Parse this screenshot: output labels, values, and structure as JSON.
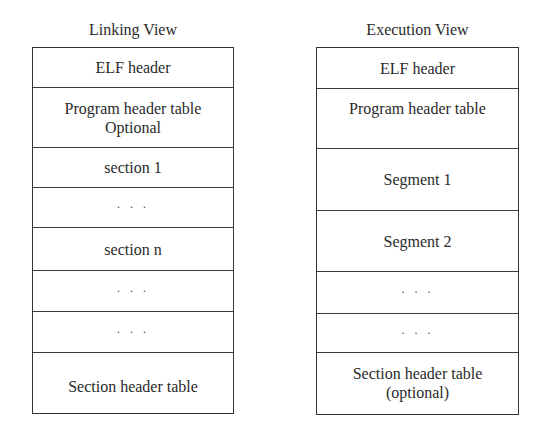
{
  "diagram": {
    "views": [
      {
        "id": "linking",
        "title": "Linking View",
        "rows": [
          {
            "lines": [
              "ELF header"
            ],
            "height": 40
          },
          {
            "lines": [
              "Program header table",
              "Optional"
            ],
            "height": 60
          },
          {
            "lines": [
              "section 1"
            ],
            "height": 40
          },
          {
            "lines": [
              "· · ·"
            ],
            "height": 40,
            "ellipsis": true
          },
          {
            "lines": [
              "section n"
            ],
            "height": 43
          },
          {
            "lines": [
              "· · ·"
            ],
            "height": 41,
            "ellipsis": true
          },
          {
            "lines": [
              "· · ·"
            ],
            "height": 41,
            "ellipsis": true
          },
          {
            "lines": [
              "Section header table"
            ],
            "height": 59
          }
        ]
      },
      {
        "id": "execution",
        "title": "Execution View",
        "rows": [
          {
            "lines": [
              "ELF header"
            ],
            "height": 41
          },
          {
            "lines": [
              "Program header table",
              ""
            ],
            "height": 60
          },
          {
            "lines": [
              "Segment 1"
            ],
            "height": 62
          },
          {
            "lines": [
              "Segment 2"
            ],
            "height": 61
          },
          {
            "lines": [
              "· · ·"
            ],
            "height": 42,
            "ellipsis": true
          },
          {
            "lines": [
              "· · ·"
            ],
            "height": 39,
            "ellipsis": true
          },
          {
            "lines": [
              "Section header table",
              "(optional)"
            ],
            "height": 60
          }
        ]
      }
    ],
    "colors": {
      "background": "#ffffff",
      "border": "#333333",
      "text": "#2a2a2a"
    }
  }
}
